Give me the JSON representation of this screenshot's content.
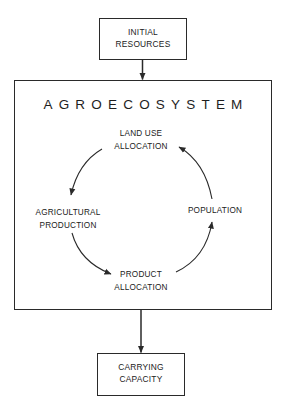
{
  "diagram": {
    "input_box": {
      "lines": [
        "INITIAL",
        "RESOURCES"
      ]
    },
    "system_box": {
      "title": "AGROECOSYSTEM",
      "cycle_nodes": [
        {
          "id": "land-use-allocation",
          "lines": [
            "LAND USE",
            "ALLOCATION"
          ]
        },
        {
          "id": "agricultural-production",
          "lines": [
            "AGRICULTURAL",
            "PRODUCTION"
          ]
        },
        {
          "id": "product-allocation",
          "lines": [
            "PRODUCT",
            "ALLOCATION"
          ]
        },
        {
          "id": "population",
          "lines": [
            "POPULATION"
          ]
        }
      ],
      "cycle_edges": [
        {
          "from": "LAND USE ALLOCATION",
          "to": "AGRICULTURAL PRODUCTION"
        },
        {
          "from": "AGRICULTURAL PRODUCTION",
          "to": "PRODUCT ALLOCATION"
        },
        {
          "from": "PRODUCT ALLOCATION",
          "to": "POPULATION"
        },
        {
          "from": "POPULATION",
          "to": "LAND USE ALLOCATION"
        }
      ]
    },
    "output_box": {
      "lines": [
        "CARRYING",
        "CAPACITY"
      ]
    },
    "flow_edges": [
      {
        "from": "INITIAL RESOURCES",
        "to": "AGROECOSYSTEM"
      },
      {
        "from": "AGROECOSYSTEM",
        "to": "CARRYING CAPACITY"
      }
    ],
    "colors": {
      "stroke": "#2a2a2a",
      "text": "#222222",
      "background": "#ffffff"
    }
  }
}
